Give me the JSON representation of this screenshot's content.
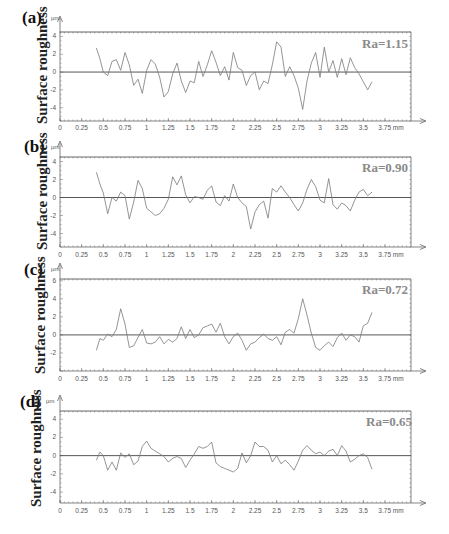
{
  "figure": {
    "ylabel": "Surface roughness",
    "y_unit": "µm",
    "x_unit": "mm",
    "xticks": [
      "0",
      "0.25",
      "0.5",
      "0.75",
      "1",
      "1.25",
      "1.5",
      "1.75",
      "2",
      "2.25",
      "2.5",
      "2.75",
      "3",
      "3.25",
      "3.5",
      "3.75 mm"
    ]
  },
  "panels": [
    {
      "letter": "(a)",
      "ra": "Ra=1.15",
      "yticks": [
        "4",
        "2",
        "0",
        "-2",
        "-4"
      ]
    },
    {
      "letter": "(b)",
      "ra": "Ra=0.90",
      "yticks": [
        "4",
        "2",
        "0",
        "-2",
        "-4"
      ]
    },
    {
      "letter": "(c)",
      "ra": "Ra=0.72",
      "yticks": [
        "6",
        "4",
        "2",
        "0",
        "-2"
      ]
    },
    {
      "letter": "(d)",
      "ra": "Ra=0.65",
      "yticks": [
        "4",
        "2",
        "0",
        "-2",
        "-4"
      ]
    }
  ],
  "chart_data": [
    {
      "type": "line",
      "title": "(a)",
      "annotation": "Ra=1.15",
      "xlabel": "mm",
      "ylabel": "Surface roughness (µm)",
      "xlim": [
        0,
        3.75
      ],
      "ylim": [
        -5.5,
        4.5
      ],
      "grid": false,
      "x": [
        0.42,
        0.46,
        0.5,
        0.55,
        0.6,
        0.65,
        0.7,
        0.75,
        0.8,
        0.85,
        0.9,
        0.95,
        1.0,
        1.05,
        1.1,
        1.15,
        1.2,
        1.25,
        1.3,
        1.35,
        1.4,
        1.45,
        1.5,
        1.55,
        1.6,
        1.65,
        1.7,
        1.75,
        1.8,
        1.85,
        1.9,
        1.95,
        2.0,
        2.05,
        2.1,
        2.15,
        2.2,
        2.25,
        2.3,
        2.35,
        2.4,
        2.45,
        2.5,
        2.55,
        2.6,
        2.65,
        2.7,
        2.75,
        2.8,
        2.85,
        2.9,
        2.95,
        3.0,
        3.05,
        3.1,
        3.15,
        3.2,
        3.25,
        3.3,
        3.35,
        3.4,
        3.45,
        3.5,
        3.55,
        3.6
      ],
      "values": [
        2.7,
        1.5,
        0.0,
        -0.4,
        1.2,
        1.4,
        0.2,
        2.2,
        0.8,
        -1.5,
        -0.8,
        -2.4,
        0.2,
        1.4,
        0.9,
        -0.6,
        -2.8,
        -2.2,
        -0.2,
        1.0,
        -1.0,
        -2.3,
        -1.0,
        -1.2,
        1.2,
        -0.5,
        0.8,
        2.4,
        1.1,
        -0.4,
        0.6,
        -0.9,
        2.2,
        0.5,
        0.2,
        -1.5,
        -0.4,
        0.0,
        -2.0,
        -1.0,
        -1.3,
        0.8,
        3.4,
        2.8,
        -0.5,
        0.6,
        -0.4,
        -1.8,
        -4.2,
        -1.0,
        1.0,
        2.2,
        -0.6,
        2.8,
        0.0,
        1.3,
        -0.6,
        1.5,
        -0.3,
        1.6,
        0.5,
        -0.2,
        -1.1,
        -2.0,
        -1.1
      ]
    },
    {
      "type": "line",
      "title": "(b)",
      "annotation": "Ra=0.90",
      "xlabel": "mm",
      "ylabel": "Surface roughness (µm)",
      "xlim": [
        0,
        3.75
      ],
      "ylim": [
        -5.5,
        4.5
      ],
      "grid": false,
      "x": [
        0.42,
        0.46,
        0.5,
        0.55,
        0.6,
        0.65,
        0.7,
        0.75,
        0.8,
        0.85,
        0.9,
        0.95,
        1.0,
        1.05,
        1.1,
        1.15,
        1.2,
        1.25,
        1.3,
        1.35,
        1.4,
        1.45,
        1.5,
        1.55,
        1.6,
        1.65,
        1.7,
        1.75,
        1.8,
        1.85,
        1.9,
        1.95,
        2.0,
        2.05,
        2.1,
        2.15,
        2.2,
        2.25,
        2.3,
        2.35,
        2.4,
        2.45,
        2.5,
        2.55,
        2.6,
        2.65,
        2.7,
        2.75,
        2.8,
        2.85,
        2.9,
        2.95,
        3.0,
        3.05,
        3.1,
        3.15,
        3.2,
        3.25,
        3.3,
        3.35,
        3.4,
        3.45,
        3.5,
        3.55,
        3.6
      ],
      "values": [
        2.8,
        1.5,
        0.5,
        -1.8,
        0.0,
        -0.4,
        0.6,
        0.2,
        -2.4,
        -0.5,
        1.9,
        1.0,
        -1.2,
        -1.6,
        -2.0,
        -1.8,
        -1.2,
        -0.2,
        2.3,
        1.4,
        2.4,
        0.3,
        -0.6,
        0.1,
        0.0,
        -0.2,
        0.8,
        1.3,
        -0.5,
        -0.9,
        0.2,
        -0.4,
        1.5,
        0.0,
        -0.6,
        -1.0,
        -3.5,
        -1.6,
        -0.8,
        -0.4,
        -2.3,
        1.0,
        0.6,
        1.3,
        0.6,
        0.0,
        -0.8,
        -1.5,
        -0.6,
        0.9,
        2.0,
        1.2,
        -0.3,
        -0.6,
        2.1,
        -0.8,
        -1.3,
        -0.6,
        -0.9,
        -1.5,
        -0.3,
        0.6,
        0.9,
        0.2,
        0.6
      ]
    },
    {
      "type": "line",
      "title": "(c)",
      "annotation": "Ra=0.72",
      "xlabel": "mm",
      "ylabel": "Surface roughness (µm)",
      "xlim": [
        0,
        3.75
      ],
      "ylim": [
        -4,
        6.2
      ],
      "grid": false,
      "x": [
        0.42,
        0.46,
        0.5,
        0.55,
        0.6,
        0.65,
        0.7,
        0.75,
        0.8,
        0.85,
        0.9,
        0.95,
        1.0,
        1.05,
        1.1,
        1.15,
        1.2,
        1.25,
        1.3,
        1.35,
        1.4,
        1.45,
        1.5,
        1.55,
        1.6,
        1.65,
        1.7,
        1.75,
        1.8,
        1.85,
        1.9,
        1.95,
        2.0,
        2.05,
        2.1,
        2.15,
        2.2,
        2.25,
        2.3,
        2.35,
        2.4,
        2.45,
        2.5,
        2.55,
        2.6,
        2.65,
        2.7,
        2.75,
        2.8,
        2.85,
        2.9,
        2.95,
        3.0,
        3.05,
        3.1,
        3.15,
        3.2,
        3.25,
        3.3,
        3.35,
        3.4,
        3.45,
        3.5,
        3.55,
        3.6
      ],
      "values": [
        -1.7,
        -0.4,
        -0.6,
        0.1,
        -0.2,
        0.6,
        2.9,
        1.2,
        -1.4,
        -1.2,
        -0.3,
        0.6,
        -0.9,
        -1.0,
        -0.8,
        -0.2,
        -1.0,
        -0.5,
        -0.8,
        -0.4,
        0.9,
        -0.4,
        0.6,
        -0.3,
        0.0,
        0.8,
        1.0,
        1.2,
        0.3,
        1.3,
        -0.2,
        -1.0,
        -0.2,
        0.2,
        -0.6,
        -1.7,
        -1.0,
        -0.8,
        -0.3,
        0.1,
        -0.4,
        -0.6,
        -0.2,
        -1.1,
        0.3,
        0.6,
        0.2,
        1.8,
        4.0,
        2.2,
        0.2,
        -1.4,
        -1.7,
        -1.2,
        -0.8,
        -1.3,
        -0.3,
        0.2,
        -0.6,
        0.0,
        -0.2,
        -0.8,
        1.0,
        1.3,
        2.5
      ]
    },
    {
      "type": "line",
      "title": "(d)",
      "annotation": "Ra=0.65",
      "xlabel": "mm",
      "ylabel": "Surface roughness (µm)",
      "xlim": [
        0,
        3.75
      ],
      "ylim": [
        -5.2,
        4.9
      ],
      "grid": false,
      "x": [
        0.42,
        0.46,
        0.5,
        0.55,
        0.6,
        0.65,
        0.7,
        0.75,
        0.8,
        0.85,
        0.9,
        0.95,
        1.0,
        1.05,
        1.1,
        1.15,
        1.2,
        1.25,
        1.3,
        1.35,
        1.4,
        1.45,
        1.5,
        1.55,
        1.6,
        1.65,
        1.7,
        1.75,
        1.8,
        1.85,
        1.9,
        1.95,
        2.0,
        2.05,
        2.1,
        2.15,
        2.2,
        2.25,
        2.3,
        2.35,
        2.4,
        2.45,
        2.5,
        2.55,
        2.6,
        2.65,
        2.7,
        2.75,
        2.8,
        2.85,
        2.9,
        2.95,
        3.0,
        3.05,
        3.1,
        3.15,
        3.2,
        3.25,
        3.3,
        3.35,
        3.4,
        3.45,
        3.5,
        3.55,
        3.6
      ],
      "values": [
        -0.5,
        0.4,
        0.0,
        -1.6,
        -0.7,
        -1.6,
        0.3,
        -0.2,
        0.2,
        -1.0,
        -0.6,
        1.0,
        1.6,
        0.8,
        0.5,
        0.2,
        -0.1,
        -0.7,
        -0.3,
        -0.1,
        -0.3,
        -1.3,
        -0.5,
        0.2,
        1.0,
        0.8,
        1.0,
        1.5,
        -0.8,
        -1.2,
        -1.4,
        -1.6,
        -1.8,
        -1.4,
        0.3,
        -0.8,
        0.0,
        1.5,
        1.0,
        1.0,
        0.6,
        -0.7,
        0.0,
        -0.9,
        -0.5,
        -1.0,
        -1.6,
        -0.6,
        0.6,
        1.1,
        0.6,
        0.2,
        0.4,
        0.0,
        0.5,
        0.7,
        0.0,
        1.1,
        0.5,
        -0.7,
        -0.4,
        0.0,
        0.2,
        -0.2,
        -1.5
      ]
    }
  ]
}
